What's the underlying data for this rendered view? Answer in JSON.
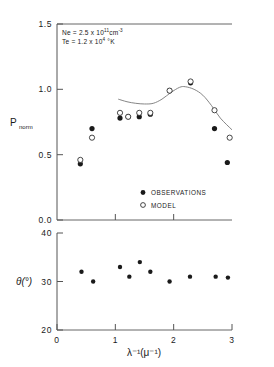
{
  "chart_data": {
    "type": "scatter",
    "title": "",
    "xlabel": "λ⁻¹(μ⁻¹)",
    "xlim": [
      0,
      3
    ],
    "xticks": [
      0,
      1,
      2,
      3
    ],
    "xticklabels": [
      "0",
      "1",
      "2",
      "3"
    ],
    "grid": false,
    "legend_position": "inside-lower-right",
    "panels": [
      {
        "name": "upper",
        "ylabel": "P",
        "ylabel_sub": "norm",
        "ylim": [
          0.0,
          1.5
        ],
        "yticks": [
          0.0,
          0.5,
          1.0,
          1.5
        ],
        "yticklabels": [
          "0.0",
          "0.5",
          "1.0",
          "1.5"
        ],
        "annotations": [
          {
            "text_prefix": "Ne = 2.5 x 10",
            "exponent": "11",
            "text_suffix": "cm",
            "suffix_exponent": "-3"
          },
          {
            "text_prefix": "Te = 1.2 x 10",
            "exponent": "4",
            "text_suffix": " °K",
            "suffix_exponent": ""
          }
        ],
        "series": [
          {
            "name": "OBSERVATIONS",
            "marker": "filled-circle",
            "points": [
              {
                "x": 0.4,
                "y": 0.43
              },
              {
                "x": 0.6,
                "y": 0.7
              },
              {
                "x": 1.08,
                "y": 0.78
              },
              {
                "x": 1.22,
                "y": 0.79
              },
              {
                "x": 1.41,
                "y": 0.79
              },
              {
                "x": 1.6,
                "y": 0.81
              },
              {
                "x": 1.93,
                "y": 0.99
              },
              {
                "x": 2.29,
                "y": 1.05
              },
              {
                "x": 2.7,
                "y": 0.7
              },
              {
                "x": 2.92,
                "y": 0.44
              }
            ]
          },
          {
            "name": "MODEL",
            "marker": "open-circle",
            "points": [
              {
                "x": 0.4,
                "y": 0.46
              },
              {
                "x": 0.6,
                "y": 0.63
              },
              {
                "x": 1.08,
                "y": 0.82
              },
              {
                "x": 1.22,
                "y": 0.79
              },
              {
                "x": 1.41,
                "y": 0.82
              },
              {
                "x": 1.6,
                "y": 0.82
              },
              {
                "x": 1.93,
                "y": 0.99
              },
              {
                "x": 2.29,
                "y": 1.06
              },
              {
                "x": 2.7,
                "y": 0.84
              },
              {
                "x": 2.96,
                "y": 0.63
              }
            ]
          },
          {
            "name": "model-curve",
            "marker": "line",
            "points": [
              {
                "x": 1.05,
                "y": 0.925
              },
              {
                "x": 1.2,
                "y": 0.905
              },
              {
                "x": 1.35,
                "y": 0.893
              },
              {
                "x": 1.5,
                "y": 0.888
              },
              {
                "x": 1.65,
                "y": 0.893
              },
              {
                "x": 1.8,
                "y": 0.925
              },
              {
                "x": 1.95,
                "y": 0.975
              },
              {
                "x": 2.1,
                "y": 1.015
              },
              {
                "x": 2.2,
                "y": 1.02
              },
              {
                "x": 2.35,
                "y": 1.0
              },
              {
                "x": 2.5,
                "y": 0.955
              },
              {
                "x": 2.65,
                "y": 0.875
              },
              {
                "x": 2.8,
                "y": 0.78
              },
              {
                "x": 3.0,
                "y": 0.69
              }
            ]
          }
        ]
      },
      {
        "name": "lower",
        "ylabel": "θ(°)",
        "ylim": [
          20,
          40
        ],
        "yticks": [
          20,
          30,
          40
        ],
        "yticklabels": [
          "20",
          "30",
          "40"
        ],
        "series": [
          {
            "name": "theta-observations",
            "marker": "filled-circle",
            "points": [
              {
                "x": 0.42,
                "y": 32.0
              },
              {
                "x": 0.62,
                "y": 30.0
              },
              {
                "x": 1.08,
                "y": 33.0
              },
              {
                "x": 1.24,
                "y": 31.0
              },
              {
                "x": 1.42,
                "y": 34.0
              },
              {
                "x": 1.6,
                "y": 32.0
              },
              {
                "x": 1.93,
                "y": 30.0
              },
              {
                "x": 2.28,
                "y": 31.0
              },
              {
                "x": 2.72,
                "y": 31.0
              },
              {
                "x": 2.93,
                "y": 30.8
              }
            ]
          }
        ]
      }
    ],
    "legend": [
      {
        "label": "OBSERVATIONS",
        "marker": "filled-circle"
      },
      {
        "label": "MODEL",
        "marker": "open-circle"
      }
    ]
  },
  "colors": {
    "ink": "#1a1a1a",
    "axis": "#555555",
    "curve": "#777777",
    "background": "#ffffff"
  }
}
